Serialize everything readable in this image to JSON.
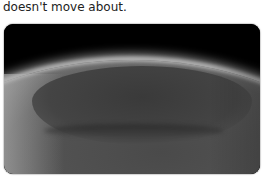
{
  "caption": {
    "text": "doesn't move about."
  },
  "photo": {
    "subject": "planetary-surface-volcano"
  }
}
